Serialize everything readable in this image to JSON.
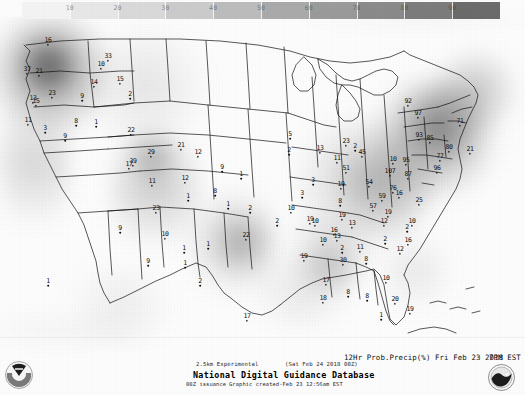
{
  "product": {
    "title": "National Digital Guidance Database",
    "experimental": "2.5km Experimental",
    "issuance_cycle": "00Z issuance",
    "issuance_time": "(Sat Feb 24 2018 00Z)",
    "graphic_created": "Graphic created-Feb 23 12:56am EST",
    "field_label": "12Hr Prob.Precip(%) Fri Feb 23 2018",
    "valid_time": "7PM EST"
  },
  "agency": {
    "noaa_logo": "noaa-seal-icon",
    "nws_logo": "nws-seal-icon"
  },
  "colorbar": {
    "label": "Probability of Precipitation (%)",
    "units": "%",
    "min": 0,
    "max": 100,
    "ticks": [
      10,
      20,
      30,
      40,
      50,
      60,
      70,
      80,
      90
    ],
    "tick_labels": [
      "10",
      "20",
      "30",
      "40",
      "50",
      "60",
      "70",
      "80",
      "90"
    ],
    "colors": [
      "#f2f2f2",
      "#e4e4e4",
      "#d6d6d6",
      "#c8c8c8",
      "#b9b9b9",
      "#aaaaaa",
      "#9b9b9b",
      "#8c8c8c",
      "#7d7d7d",
      "#6e6e6e"
    ]
  },
  "chart_data": {
    "type": "heatmap",
    "subtitle": "National Digital Guidance Database - 2.5km Experimental",
    "xlabel": "Longitude",
    "ylabel": "Latitude",
    "grid": false,
    "legend_position": "top",
    "colorbar_range": [
      0,
      100
    ],
    "colorbar_ticks": [
      10,
      20,
      30,
      40,
      50,
      60,
      70,
      80,
      90
    ],
    "value_units": "percent",
    "stations": [
      {
        "label": "16",
        "value": 16,
        "x": 48,
        "y": 24
      },
      {
        "label": "10",
        "value": 10,
        "x": 101,
        "y": 48
      },
      {
        "label": "37",
        "value": 37,
        "x": 27,
        "y": 53
      },
      {
        "label": "21",
        "value": 21,
        "x": 39,
        "y": 55
      },
      {
        "label": "33",
        "value": 33,
        "x": 108,
        "y": 40
      },
      {
        "label": "15",
        "value": 15,
        "x": 120,
        "y": 63
      },
      {
        "label": "13",
        "value": 13,
        "x": 33,
        "y": 82
      },
      {
        "label": "23",
        "value": 23,
        "x": 52,
        "y": 77
      },
      {
        "label": "15",
        "value": 15,
        "x": 36,
        "y": 85
      },
      {
        "label": "9",
        "value": 9,
        "x": 82,
        "y": 80
      },
      {
        "label": "14",
        "value": 14,
        "x": 94,
        "y": 66
      },
      {
        "label": "11",
        "value": 11,
        "x": 28,
        "y": 104
      },
      {
        "label": "3",
        "value": 3,
        "x": 45,
        "y": 112
      },
      {
        "label": "8",
        "value": 8,
        "x": 76,
        "y": 105
      },
      {
        "label": "1",
        "value": 1,
        "x": 96,
        "y": 106
      },
      {
        "label": "22",
        "value": 22,
        "x": 131,
        "y": 114
      },
      {
        "label": "2",
        "value": 2,
        "x": 130,
        "y": 78
      },
      {
        "label": "9",
        "value": 9,
        "x": 65,
        "y": 120
      },
      {
        "label": "17",
        "value": 17,
        "x": 129,
        "y": 148
      },
      {
        "label": "39",
        "value": 39,
        "x": 133,
        "y": 145
      },
      {
        "label": "29",
        "value": 29,
        "x": 151,
        "y": 136
      },
      {
        "label": "21",
        "value": 21,
        "x": 181,
        "y": 129
      },
      {
        "label": "12",
        "value": 12,
        "x": 198,
        "y": 136
      },
      {
        "label": "11",
        "value": 11,
        "x": 152,
        "y": 165
      },
      {
        "label": "12",
        "value": 12,
        "x": 185,
        "y": 162
      },
      {
        "label": "9",
        "value": 9,
        "x": 222,
        "y": 151
      },
      {
        "label": "1",
        "value": 1,
        "x": 241,
        "y": 158
      },
      {
        "label": "23",
        "value": 23,
        "x": 156,
        "y": 192
      },
      {
        "label": "1",
        "value": 1,
        "x": 188,
        "y": 180
      },
      {
        "label": "8",
        "value": 8,
        "x": 215,
        "y": 175
      },
      {
        "label": "1",
        "value": 1,
        "x": 228,
        "y": 188
      },
      {
        "label": "2",
        "value": 2,
        "x": 250,
        "y": 192
      },
      {
        "label": "9",
        "value": 9,
        "x": 120,
        "y": 212
      },
      {
        "label": "10",
        "value": 10,
        "x": 165,
        "y": 218
      },
      {
        "label": "1",
        "value": 1,
        "x": 184,
        "y": 232
      },
      {
        "label": "1",
        "value": 1,
        "x": 208,
        "y": 228
      },
      {
        "label": "22",
        "value": 22,
        "x": 246,
        "y": 219
      },
      {
        "label": "9",
        "value": 9,
        "x": 148,
        "y": 245
      },
      {
        "label": "1",
        "value": 1,
        "x": 185,
        "y": 247
      },
      {
        "label": "2",
        "value": 2,
        "x": 200,
        "y": 265
      },
      {
        "label": "1",
        "value": 1,
        "x": 48,
        "y": 265
      },
      {
        "label": "5",
        "value": 5,
        "x": 290,
        "y": 118
      },
      {
        "label": "2",
        "value": 2,
        "x": 289,
        "y": 134
      },
      {
        "label": "13",
        "value": 13,
        "x": 320,
        "y": 132
      },
      {
        "label": "11",
        "value": 11,
        "x": 337,
        "y": 142
      },
      {
        "label": "23",
        "value": 23,
        "x": 346,
        "y": 125
      },
      {
        "label": "2",
        "value": 2,
        "x": 355,
        "y": 130
      },
      {
        "label": "45",
        "value": 45,
        "x": 362,
        "y": 136
      },
      {
        "label": "51",
        "value": 51,
        "x": 346,
        "y": 152
      },
      {
        "label": "54",
        "value": 54,
        "x": 369,
        "y": 166
      },
      {
        "label": "3",
        "value": 3,
        "x": 313,
        "y": 164
      },
      {
        "label": "19",
        "value": 19,
        "x": 341,
        "y": 168
      },
      {
        "label": "3",
        "value": 3,
        "x": 302,
        "y": 177
      },
      {
        "label": "8",
        "value": 8,
        "x": 340,
        "y": 185
      },
      {
        "label": "107",
        "value": 107,
        "x": 390,
        "y": 155
      },
      {
        "label": "76",
        "value": 76,
        "x": 393,
        "y": 172
      },
      {
        "label": "59",
        "value": 59,
        "x": 382,
        "y": 180
      },
      {
        "label": "57",
        "value": 57,
        "x": 373,
        "y": 190
      },
      {
        "label": "19",
        "value": 19,
        "x": 388,
        "y": 196
      },
      {
        "label": "10",
        "value": 10,
        "x": 291,
        "y": 192
      },
      {
        "label": "19",
        "value": 19,
        "x": 342,
        "y": 199
      },
      {
        "label": "92",
        "value": 92,
        "x": 408,
        "y": 85
      },
      {
        "label": "97",
        "value": 97,
        "x": 418,
        "y": 97
      },
      {
        "label": "93",
        "value": 93,
        "x": 419,
        "y": 119
      },
      {
        "label": "85",
        "value": 85,
        "x": 430,
        "y": 122
      },
      {
        "label": "80",
        "value": 80,
        "x": 449,
        "y": 131
      },
      {
        "label": "77",
        "value": 77,
        "x": 440,
        "y": 140
      },
      {
        "label": "96",
        "value": 96,
        "x": 437,
        "y": 152
      },
      {
        "label": "10",
        "value": 10,
        "x": 393,
        "y": 143
      },
      {
        "label": "95",
        "value": 95,
        "x": 406,
        "y": 144
      },
      {
        "label": "87",
        "value": 87,
        "x": 408,
        "y": 158
      },
      {
        "label": "71",
        "value": 71,
        "x": 460,
        "y": 105
      },
      {
        "label": "21",
        "value": 21,
        "x": 470,
        "y": 133
      },
      {
        "label": "25",
        "value": 25,
        "x": 419,
        "y": 184
      },
      {
        "label": "16",
        "value": 16,
        "x": 399,
        "y": 177
      },
      {
        "label": "12",
        "value": 12,
        "x": 384,
        "y": 205
      },
      {
        "label": "10",
        "value": 10,
        "x": 315,
        "y": 205
      },
      {
        "label": "13",
        "value": 13,
        "x": 352,
        "y": 207
      },
      {
        "label": "19",
        "value": 19,
        "x": 310,
        "y": 203
      },
      {
        "label": "16",
        "value": 16,
        "x": 334,
        "y": 214
      },
      {
        "label": "13",
        "value": 13,
        "x": 337,
        "y": 220
      },
      {
        "label": "2",
        "value": 2,
        "x": 407,
        "y": 211
      },
      {
        "label": "10",
        "value": 10,
        "x": 412,
        "y": 205
      },
      {
        "label": "2",
        "value": 2,
        "x": 385,
        "y": 223
      },
      {
        "label": "16",
        "value": 16,
        "x": 408,
        "y": 224
      },
      {
        "label": "10",
        "value": 10,
        "x": 323,
        "y": 224
      },
      {
        "label": "2",
        "value": 2,
        "x": 342,
        "y": 232
      },
      {
        "label": "11",
        "value": 11,
        "x": 360,
        "y": 231
      },
      {
        "label": "12",
        "value": 12,
        "x": 400,
        "y": 233
      },
      {
        "label": "19",
        "value": 19,
        "x": 304,
        "y": 240
      },
      {
        "label": "30",
        "value": 30,
        "x": 343,
        "y": 244
      },
      {
        "label": "8",
        "value": 8,
        "x": 366,
        "y": 243
      },
      {
        "label": "10",
        "value": 10,
        "x": 386,
        "y": 262
      },
      {
        "label": "17",
        "value": 17,
        "x": 326,
        "y": 264
      },
      {
        "label": "8",
        "value": 8,
        "x": 348,
        "y": 276
      },
      {
        "label": "8",
        "value": 8,
        "x": 367,
        "y": 280
      },
      {
        "label": "20",
        "value": 20,
        "x": 395,
        "y": 283
      },
      {
        "label": "19",
        "value": 19,
        "x": 410,
        "y": 293
      },
      {
        "label": "1",
        "value": 1,
        "x": 381,
        "y": 299
      },
      {
        "label": "2",
        "value": 2,
        "x": 277,
        "y": 205
      },
      {
        "label": "18",
        "value": 18,
        "x": 323,
        "y": 282
      },
      {
        "label": "17",
        "value": 17,
        "x": 247,
        "y": 300
      }
    ],
    "shaded_regions": [
      {
        "name": "pacific-northwest",
        "intensity": 0.72
      },
      {
        "name": "northern-rockies",
        "intensity": 0.45
      },
      {
        "name": "central-rockies",
        "intensity": 0.5
      },
      {
        "name": "texas-panhandle",
        "intensity": 0.4
      },
      {
        "name": "lower-mississippi",
        "intensity": 0.55
      },
      {
        "name": "ohio-valley",
        "intensity": 0.7
      },
      {
        "name": "northeast",
        "intensity": 0.88
      },
      {
        "name": "great-lakes",
        "intensity": 0.62
      }
    ]
  }
}
